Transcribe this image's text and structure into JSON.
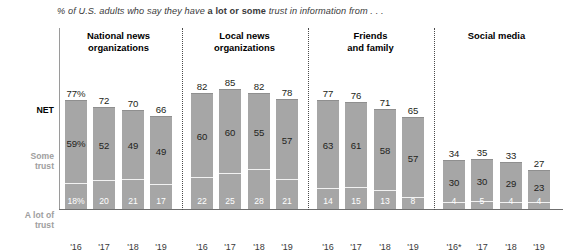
{
  "subtitle": {
    "pre": "% of U.S. adults who say they have ",
    "bold": "a lot or some",
    "post": " trust in information from . . ."
  },
  "row_labels": {
    "net": "NET",
    "some_line1": "Some",
    "some_line2": "trust",
    "alot_line1": "A lot of",
    "alot_line2": "trust"
  },
  "chart_data": {
    "type": "bar",
    "title": "% of U.S. adults who say they have a lot or some trust in information from . . .",
    "subtype": "stacked-bar",
    "xlabel": "",
    "ylabel": "",
    "ylim": [
      0,
      100
    ],
    "grid": false,
    "legend_position": "left-row-labels",
    "stack_order": [
      "A lot of trust",
      "Some trust"
    ],
    "series": [
      {
        "name": "A lot of trust",
        "color": "#a6a6a6",
        "label_color": "#ffffff"
      },
      {
        "name": "Some trust",
        "color": "#a6a6a6",
        "label_color": "#231f20"
      },
      {
        "name": "NET",
        "color": "none",
        "label_color": "#231f20"
      }
    ],
    "groups": [
      {
        "header_line1": "National news",
        "header_line2": "organizations",
        "categories": [
          "'16",
          "'17",
          "'18",
          "'19"
        ],
        "net": [
          77,
          72,
          70,
          66
        ],
        "some": [
          59,
          52,
          49,
          49
        ],
        "alot": [
          18,
          20,
          21,
          17
        ],
        "net_labels": [
          "77%",
          "72",
          "70",
          "66"
        ],
        "some_labels": [
          "59%",
          "52",
          "49",
          "49"
        ],
        "alot_labels": [
          "18%",
          "20",
          "21",
          "17"
        ]
      },
      {
        "header_line1": "Local news",
        "header_line2": "organizations",
        "categories": [
          "'16",
          "'17",
          "'18",
          "'19"
        ],
        "net": [
          82,
          85,
          82,
          78
        ],
        "some": [
          60,
          60,
          55,
          57
        ],
        "alot": [
          22,
          25,
          28,
          21
        ],
        "net_labels": [
          "82",
          "85",
          "82",
          "78"
        ],
        "some_labels": [
          "60",
          "60",
          "55",
          "57"
        ],
        "alot_labels": [
          "22",
          "25",
          "28",
          "21"
        ]
      },
      {
        "header_line1": "Friends",
        "header_line2": "and family",
        "categories": [
          "'16",
          "'17",
          "'18",
          "'19"
        ],
        "net": [
          77,
          76,
          71,
          65
        ],
        "some": [
          63,
          61,
          58,
          57
        ],
        "alot": [
          14,
          15,
          13,
          8
        ],
        "net_labels": [
          "77",
          "76",
          "71",
          "65"
        ],
        "some_labels": [
          "63",
          "61",
          "58",
          "57"
        ],
        "alot_labels": [
          "14",
          "15",
          "13",
          "8"
        ]
      },
      {
        "header_line1": "Social media",
        "header_line2": "",
        "categories": [
          "'16*",
          "'17",
          "'18",
          "'19"
        ],
        "net": [
          34,
          35,
          33,
          27
        ],
        "some": [
          30,
          30,
          29,
          23
        ],
        "alot": [
          4,
          5,
          4,
          4
        ],
        "net_labels": [
          "34",
          "35",
          "33",
          "27"
        ],
        "some_labels": [
          "30",
          "30",
          "29",
          "23"
        ],
        "alot_labels": [
          "4",
          "5",
          "4",
          "4"
        ]
      }
    ]
  },
  "colors": {
    "bar": "#a6a6a6",
    "bar_top_edge": "#8f8f8f",
    "axis": "#6f6f6f",
    "divider": "#4a4a4a",
    "row_label_muted": "#9e9e9e",
    "text": "#231f20"
  }
}
